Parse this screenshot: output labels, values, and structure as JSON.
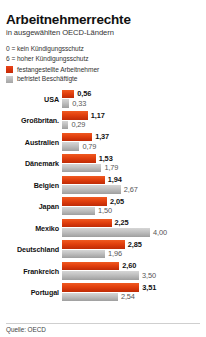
{
  "header": {
    "title": "Arbeitnehmerrechte",
    "subtitle": "in ausgewählten OECD-Ländern"
  },
  "scale_notes": [
    "0 = kein Kündigungsschutz",
    "6 = hoher Kündigungsschutz"
  ],
  "legend": {
    "items": [
      {
        "label": "festangestellte Arbeitnehmer",
        "color": "#d8310a",
        "key": "permanent"
      },
      {
        "label": "befristet Beschäftigte",
        "color": "#b4b4b4",
        "key": "temporary"
      }
    ]
  },
  "footer": {
    "source": "Quelle: OECD"
  },
  "chart_data": {
    "type": "bar",
    "orientation": "horizontal",
    "title": "Arbeitnehmerrechte",
    "subtitle": "in ausgewählten OECD-Ländern",
    "xlabel": "",
    "ylabel": "",
    "xlim": [
      0,
      4.0
    ],
    "grid": false,
    "legend_position": "top-left",
    "categories": [
      "USA",
      "Großbritan.",
      "Australien",
      "Dänemark",
      "Belgien",
      "Japan",
      "Mexiko",
      "Deutschland",
      "Frankreich",
      "Portugal"
    ],
    "series": [
      {
        "name": "festangestellte Arbeitnehmer",
        "color": "#d8310a",
        "values": [
          0.56,
          1.17,
          1.37,
          1.53,
          1.94,
          2.05,
          2.25,
          2.85,
          2.6,
          3.51
        ],
        "labels": [
          "0,56",
          "1,17",
          "1,37",
          "1,53",
          "1,94",
          "2,05",
          "2,25",
          "2,85",
          "2,60",
          "3,51"
        ]
      },
      {
        "name": "befristet Beschäftigte",
        "color": "#b4b4b4",
        "values": [
          0.33,
          0.29,
          0.79,
          1.79,
          2.67,
          1.5,
          4.0,
          1.96,
          3.5,
          2.54
        ],
        "labels": [
          "0,33",
          "0,29",
          "0,79",
          "1,79",
          "2,67",
          "1,50",
          "4,00",
          "1,96",
          "3,50",
          "2,54"
        ]
      }
    ]
  }
}
